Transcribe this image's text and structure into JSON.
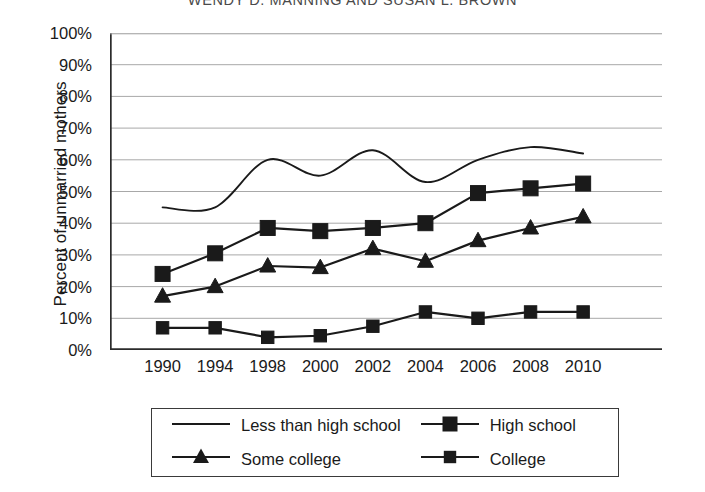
{
  "running_head": "WENDY D. MANNING AND SUSAN L. BROWN",
  "chart_data": {
    "type": "line",
    "title": "",
    "xlabel": "",
    "ylabel": "Percent of unmarried mothers",
    "categories": [
      "1990",
      "1994",
      "1998",
      "2000",
      "2002",
      "2004",
      "2006",
      "2008",
      "2010"
    ],
    "x_tick_labels": [
      "1990",
      "1994",
      "1998",
      "2000",
      "2002",
      "2004",
      "2006",
      "2008",
      "2010"
    ],
    "y_tick_labels": [
      "0%",
      "10%",
      "20%",
      "30%",
      "40%",
      "50%",
      "60%",
      "70%",
      "80%",
      "90%",
      "100%"
    ],
    "y_tick_values": [
      0,
      10,
      20,
      30,
      40,
      50,
      60,
      70,
      80,
      90,
      100
    ],
    "ylim": [
      0,
      100
    ],
    "grid": "horizontal",
    "legend_position": "below-axes",
    "series": [
      {
        "name": "Less than high school",
        "marker": "none",
        "smooth": true,
        "color": "#1a1a1a",
        "values": [
          45,
          45,
          60,
          55,
          63,
          53,
          60,
          64,
          62
        ]
      },
      {
        "name": "High school",
        "marker": "square",
        "smooth": false,
        "color": "#1a1a1a",
        "values": [
          24,
          30.5,
          38.5,
          37.5,
          38.5,
          40,
          49.5,
          51,
          52.5
        ]
      },
      {
        "name": "Some college",
        "marker": "triangle",
        "smooth": false,
        "color": "#1a1a1a",
        "values": [
          17,
          20,
          26.5,
          26,
          32,
          28,
          34.5,
          38.5,
          42
        ]
      },
      {
        "name": "College",
        "marker": "square-small",
        "smooth": false,
        "color": "#1a1a1a",
        "values": [
          7,
          7,
          4,
          4.5,
          7.5,
          12,
          10,
          12,
          12
        ]
      }
    ]
  },
  "legend": {
    "entries": [
      {
        "label": "Less than high school",
        "marker": "none"
      },
      {
        "label": "High school",
        "marker": "square"
      },
      {
        "label": "Some college",
        "marker": "triangle"
      },
      {
        "label": "College",
        "marker": "square-small"
      }
    ]
  },
  "colors": {
    "line": "#1a1a1a",
    "grid": "#a8a8a8",
    "axis": "#2b2b2b",
    "background": "#ffffff"
  }
}
